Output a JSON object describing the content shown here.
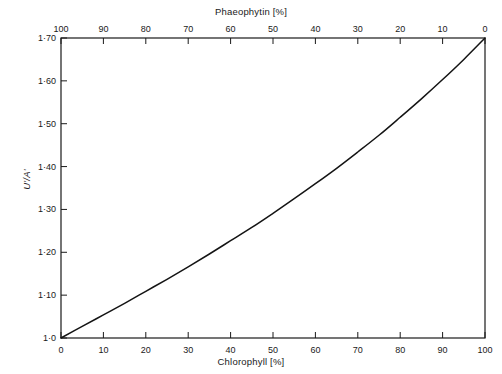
{
  "chart_data": {
    "type": "line",
    "title": "",
    "xlabel": "Chlorophyll [%]",
    "ylabel": "U'/A'",
    "x2label": "Phaeophytin [%]",
    "xlim": [
      0,
      100
    ],
    "ylim": [
      1.0,
      1.7
    ],
    "x2lim": [
      100,
      0
    ],
    "grid": false,
    "legend": null,
    "x_ticks": [
      0,
      10,
      20,
      30,
      40,
      50,
      60,
      70,
      80,
      90,
      100
    ],
    "x_tick_labels": [
      "0",
      "10",
      "20",
      "30",
      "40",
      "50",
      "60",
      "70",
      "80",
      "90",
      "100"
    ],
    "x2_ticks": [
      100,
      90,
      80,
      70,
      60,
      50,
      40,
      30,
      20,
      10,
      0
    ],
    "x2_tick_labels": [
      "100",
      "90",
      "80",
      "70",
      "60",
      "50",
      "40",
      "30",
      "20",
      "10",
      "0"
    ],
    "y_ticks": [
      1.0,
      1.1,
      1.2,
      1.3,
      1.4,
      1.5,
      1.6,
      1.7
    ],
    "y_tick_labels": [
      "1·0",
      "1·10",
      "1·20",
      "1·30",
      "1·40",
      "1·50",
      "1·60",
      "1·70"
    ],
    "series": [
      {
        "name": "U'/A' vs Chlorophyll",
        "x": [
          0,
          5,
          10,
          15,
          20,
          25,
          30,
          35,
          40,
          45,
          50,
          55,
          60,
          65,
          70,
          75,
          80,
          85,
          90,
          95,
          100
        ],
        "values": [
          1.0,
          1.027,
          1.054,
          1.081,
          1.109,
          1.137,
          1.166,
          1.196,
          1.227,
          1.258,
          1.291,
          1.325,
          1.36,
          1.396,
          1.434,
          1.473,
          1.515,
          1.558,
          1.603,
          1.65,
          1.7
        ]
      }
    ]
  },
  "axes": {
    "top_title": "Phaeophytin [%]",
    "bottom_title": "Chlorophyll [%]",
    "left_title": "U'/A'"
  }
}
